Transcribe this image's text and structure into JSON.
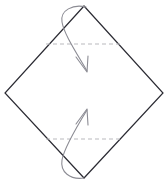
{
  "diagram": {
    "title": "Square sheet with two horizontal crease lines and two folding arrows",
    "type": "origami-fold-step",
    "canvas": {
      "width": 168,
      "height": 184,
      "background": "#ffffff"
    },
    "sheet": {
      "name": "square-sheet-diamond",
      "shape": "square rotated 45 degrees (diamond)",
      "fill": "#ffffff",
      "stroke": "#2b2b33",
      "stroke_width": 1.2,
      "vertices": {
        "top": {
          "x": 84,
          "y": 6
        },
        "right": {
          "x": 163,
          "y": 93
        },
        "bottom": {
          "x": 84,
          "y": 178
        },
        "left": {
          "x": 5,
          "y": 93
        }
      },
      "points_path": "84,6 163,93 84,178 5,93"
    },
    "creases": [
      {
        "name": "upper-crease-line",
        "label": "upper horizontal crease",
        "x1": 46,
        "y1": 44,
        "x2": 123,
        "y2": 44,
        "stroke": "#b9b9bd",
        "stroke_width": 1,
        "dash": "4 3"
      },
      {
        "name": "lower-crease-line",
        "label": "lower horizontal crease",
        "x1": 46,
        "y1": 139,
        "x2": 123,
        "y2": 139,
        "stroke": "#b9b9bd",
        "stroke_width": 1,
        "dash": "4 3"
      }
    ],
    "arrows": [
      {
        "name": "upper-fold-arrow",
        "label": "fold top corner down to upper crease",
        "direction": "down",
        "stroke": "#8c8c94",
        "stroke_width": 1.1,
        "path": "M 86 7 C 73 4, 60 10, 62 22 C 64 34, 76 52, 87 71",
        "head": "M 76 57 L 87 72 L 88 56"
      },
      {
        "name": "lower-fold-arrow",
        "label": "fold bottom corner up to lower crease",
        "direction": "up",
        "stroke": "#8c8c94",
        "stroke_width": 1.1,
        "path": "M 84 178 C 70 180, 60 172, 62 160 C 64 148, 76 128, 87 110",
        "head": "M 76 124 L 87 109 L 88 125"
      }
    ]
  }
}
